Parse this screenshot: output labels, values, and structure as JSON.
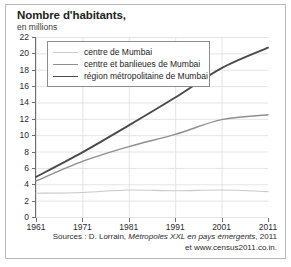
{
  "chart_data": {
    "type": "line",
    "title": "Nombre d'habitants,",
    "subtitle": "en millions",
    "xlabel": "",
    "ylabel": "",
    "categories": [
      1961,
      1971,
      1981,
      1991,
      2001,
      2011
    ],
    "x_tick_labels": [
      "1961",
      "1971",
      "1981",
      "1991",
      "2001",
      "2011"
    ],
    "y_tick_labels": [
      "0",
      "2",
      "4",
      "6",
      "8",
      "10",
      "12",
      "14",
      "16",
      "18",
      "20",
      "22"
    ],
    "y_ticks": [
      0,
      2,
      4,
      6,
      8,
      10,
      12,
      14,
      16,
      18,
      20,
      22
    ],
    "ylim": [
      0,
      22
    ],
    "xlim": [
      1961,
      2011
    ],
    "grid": true,
    "legend_position": "top-left-inside",
    "series": [
      {
        "name": "centre de Mumbai",
        "values": [
          2.9,
          3.0,
          3.3,
          3.2,
          3.3,
          3.1
        ],
        "color": "#c9c9c9",
        "width": 1.1
      },
      {
        "name": "centre et banlieues de Mumbai",
        "values": [
          4.4,
          6.8,
          8.6,
          10.1,
          11.9,
          12.5
        ],
        "color": "#8f8f8f",
        "width": 1.5
      },
      {
        "name": "région métropolitaine de Mumbai",
        "values": [
          4.9,
          7.9,
          11.2,
          14.6,
          18.2,
          20.7
        ],
        "color": "#4a4a4a",
        "width": 1.9
      }
    ],
    "annotations": {
      "source_line_1_prefix": "Sources : D. Lorrain, ",
      "source_line_1_italic": "Métropoles XXL en pays émergents",
      "source_line_1_suffix": ", 2011",
      "source_line_2": "et www.census2011.co.in."
    }
  },
  "colors": {
    "frame_border": "#b9b9b9",
    "axis": "#6e6e6e",
    "grid": "#e4e4e4",
    "text": "#231f20",
    "legend_border": "#8d8d8d",
    "background": "#ffffff"
  }
}
